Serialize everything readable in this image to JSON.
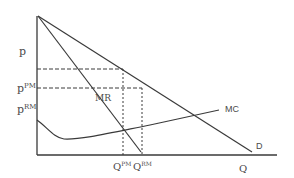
{
  "diagram": {
    "axes": {
      "y_label": "p",
      "x_label": "Q"
    },
    "price_labels": {
      "p_pm_base": "p",
      "p_pm_sup": "PM",
      "p_rm_base": "p",
      "p_rm_sup": "RM"
    },
    "quantity_labels": {
      "q_pm_base": "Q",
      "q_pm_sup": "PM",
      "q_rm_base": "Q",
      "q_rm_sup": "RM"
    },
    "curves": {
      "demand": "D",
      "marginal_revenue": "MR",
      "marginal_cost": "MC"
    },
    "colors": {
      "line": "#3a3a3a",
      "text": "#4a4a4a",
      "background": "#ffffff"
    }
  }
}
